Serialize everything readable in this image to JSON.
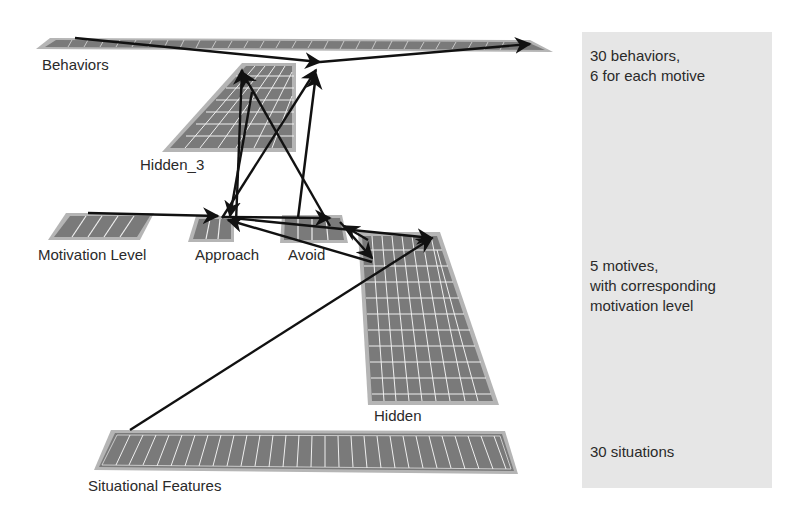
{
  "layers": {
    "behaviors": {
      "label": "Behaviors",
      "units": 30
    },
    "hidden_3": {
      "label": "Hidden_3"
    },
    "motivation_level": {
      "label": "Motivation Level",
      "units": 5
    },
    "approach": {
      "label": "Approach"
    },
    "avoid": {
      "label": "Avoid"
    },
    "hidden": {
      "label": "Hidden"
    },
    "situational_features": {
      "label": "Situational Features",
      "units": 30
    }
  },
  "notes": {
    "behaviors_line1": "30 behaviors,",
    "behaviors_line2": "6 for each motive",
    "motives_line1": "5 motives,",
    "motives_line2": "with corresponding",
    "motives_line3": "motivation level",
    "situations": "30 situations"
  },
  "colors": {
    "layer_fill": "#7a7a7a",
    "layer_border": "#b5b5b5",
    "grid_line": "#f2f2f2",
    "arrow": "#111111",
    "panel_bg": "#e6e6e6"
  }
}
